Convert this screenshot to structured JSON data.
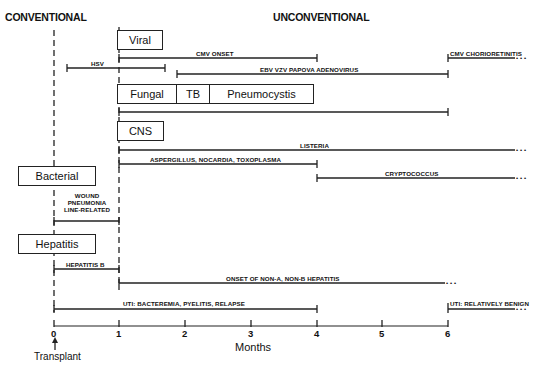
{
  "headers": {
    "conventional": "CONVENTIONAL",
    "unconventional": "UNCONVENTIONAL"
  },
  "categories": {
    "viral": "Viral",
    "fungal": "Fungal",
    "tb": "TB",
    "pneumocystis": "Pneumocystis",
    "cns": "CNS",
    "bacterial": "Bacterial",
    "hepatitis": "Hepatitis"
  },
  "timelines": [
    {
      "id": "cmv-onset",
      "label": "CMV ONSET",
      "start": 1,
      "end": 4,
      "continues": false
    },
    {
      "id": "hsv",
      "label": "HSV",
      "start": 0.2,
      "end": 1.7,
      "continues": false
    },
    {
      "id": "cmv-chorioretinitis",
      "label": "CMV CHORIORETINITIS",
      "start": 6,
      "end": 6.9,
      "continues": true
    },
    {
      "id": "ebv-vzv",
      "label": "EBV VZV PAPOVA ADENOVIRUS",
      "start": 1.9,
      "end": 6,
      "continues": false
    },
    {
      "id": "fungal-tb-pcp",
      "label": "",
      "start": 1,
      "end": 6,
      "continues": false
    },
    {
      "id": "listeria",
      "label": "LISTERIA",
      "start": 1,
      "end": 6.9,
      "continues": true
    },
    {
      "id": "aspergillus",
      "label": "ASPERGILLUS, NOCARDIA, TOXOPLASMA",
      "start": 1,
      "end": 4,
      "continues": false
    },
    {
      "id": "cryptococcus",
      "label": "CRYPTOCOCCUS",
      "start": 4,
      "end": 6.9,
      "continues": true
    },
    {
      "id": "wound",
      "label_lines": [
        "WOUND",
        "PNEUMONIA",
        "LINE-RELATED"
      ],
      "start": 0,
      "end": 1,
      "continues": false
    },
    {
      "id": "hepatitis-b",
      "label": "HEPATITIS B",
      "start": 0,
      "end": 1,
      "continues": false
    },
    {
      "id": "non-a-non-b",
      "label": "ONSET OF NON-A, NON-B HEPATITIS",
      "start": 1,
      "end": 6,
      "continues": true
    },
    {
      "id": "uti-early",
      "label": "UTI: BACTEREMIA, PYELITIS, RELAPSE",
      "start": 0,
      "end": 4,
      "continues": false
    },
    {
      "id": "uti-late",
      "label": "UTI: RELATIVELY BENIGN",
      "start": 6,
      "end": 6.9,
      "continues": true
    }
  ],
  "axis": {
    "ticks": [
      "0",
      "1",
      "2",
      "3",
      "4",
      "5",
      "6"
    ],
    "title": "Months",
    "origin_label": "Transplant",
    "range": [
      0,
      6
    ]
  },
  "ellipsis": "• • •"
}
